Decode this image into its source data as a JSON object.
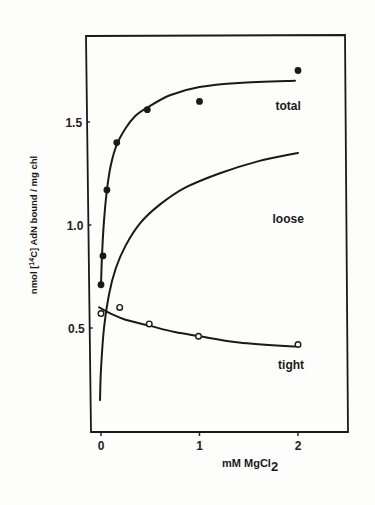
{
  "chart_data": {
    "type": "line",
    "title": "",
    "xlabel": "mM MgCl",
    "xlabel_subscript": "2",
    "ylabel": "nmol [14C] AdN bound / mg chl",
    "ylabel_parts": {
      "pre": "nmol [",
      "sup": "14",
      "post": "C] AdN bound / mg chl"
    },
    "xlim": [
      -0.1,
      2.5
    ],
    "ylim": [
      0,
      1.95
    ],
    "grid": false,
    "legend": "inline labels",
    "x_ticks": [
      {
        "value": 0,
        "label": "0"
      },
      {
        "value": 1,
        "label": "1"
      },
      {
        "value": 2,
        "label": "2"
      }
    ],
    "y_ticks": [
      {
        "value": 0.5,
        "label": "0.5"
      },
      {
        "value": 1.0,
        "label": "1.0"
      },
      {
        "value": 1.5,
        "label": "1.5"
      }
    ],
    "series": [
      {
        "name": "total",
        "marker": "filled-circle",
        "points": [
          {
            "x": 0.0,
            "y": 0.71
          },
          {
            "x": 0.02,
            "y": 0.85
          },
          {
            "x": 0.06,
            "y": 1.17
          },
          {
            "x": 0.16,
            "y": 1.4
          },
          {
            "x": 0.47,
            "y": 1.56
          },
          {
            "x": 1.0,
            "y": 1.6
          },
          {
            "x": 2.0,
            "y": 1.75
          }
        ],
        "fit_curve": [
          {
            "x": 0.0,
            "y": 0.71
          },
          {
            "x": 0.01,
            "y": 0.85
          },
          {
            "x": 0.03,
            "y": 1.02
          },
          {
            "x": 0.06,
            "y": 1.17
          },
          {
            "x": 0.1,
            "y": 1.29
          },
          {
            "x": 0.16,
            "y": 1.39
          },
          {
            "x": 0.25,
            "y": 1.47
          },
          {
            "x": 0.35,
            "y": 1.53
          },
          {
            "x": 0.47,
            "y": 1.57
          },
          {
            "x": 0.7,
            "y": 1.63
          },
          {
            "x": 1.0,
            "y": 1.67
          },
          {
            "x": 1.4,
            "y": 1.69
          },
          {
            "x": 1.97,
            "y": 1.7
          }
        ],
        "label_pos": {
          "x": 1.9,
          "y": 1.56
        }
      },
      {
        "name": "loose",
        "marker": "none",
        "points": [],
        "fit_curve": [
          {
            "x": -0.01,
            "y": 0.15
          },
          {
            "x": 0.0,
            "y": 0.3
          },
          {
            "x": 0.03,
            "y": 0.5
          },
          {
            "x": 0.08,
            "y": 0.66
          },
          {
            "x": 0.15,
            "y": 0.79
          },
          {
            "x": 0.25,
            "y": 0.9
          },
          {
            "x": 0.4,
            "y": 1.01
          },
          {
            "x": 0.6,
            "y": 1.1
          },
          {
            "x": 0.85,
            "y": 1.18
          },
          {
            "x": 1.2,
            "y": 1.25
          },
          {
            "x": 1.6,
            "y": 1.31
          },
          {
            "x": 2.0,
            "y": 1.35
          }
        ],
        "label_pos": {
          "x": 1.9,
          "y": 1.01
        }
      },
      {
        "name": "tight",
        "marker": "open-circle",
        "points": [
          {
            "x": 0.0,
            "y": 0.57
          },
          {
            "x": 0.19,
            "y": 0.6
          },
          {
            "x": 0.49,
            "y": 0.52
          },
          {
            "x": 0.99,
            "y": 0.46
          },
          {
            "x": 2.0,
            "y": 0.42
          }
        ],
        "fit_curve": [
          {
            "x": -0.02,
            "y": 0.6
          },
          {
            "x": 0.1,
            "y": 0.57
          },
          {
            "x": 0.25,
            "y": 0.54
          },
          {
            "x": 0.5,
            "y": 0.51
          },
          {
            "x": 0.75,
            "y": 0.48
          },
          {
            "x": 1.0,
            "y": 0.46
          },
          {
            "x": 1.4,
            "y": 0.43
          },
          {
            "x": 1.97,
            "y": 0.41
          }
        ],
        "label_pos": {
          "x": 1.93,
          "y": 0.3
        }
      }
    ]
  },
  "colors": {
    "ink": "#1a1a1a",
    "background": "#fdfdfb"
  }
}
